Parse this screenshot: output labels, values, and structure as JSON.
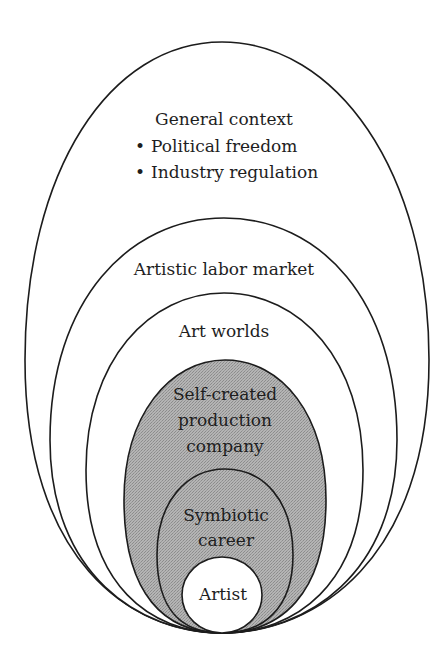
{
  "diagram": {
    "type": "nested-ellipses",
    "colors": {
      "stroke": "#1c1c1c",
      "background": "#ffffff",
      "shaded_fill": "#a9a9a9",
      "text": "#1e1e1e"
    },
    "layers": [
      {
        "id": "general-context",
        "title": "General context",
        "bullets": [
          "Political freedom",
          "Industry regulation"
        ],
        "shaded": false
      },
      {
        "id": "artistic-labor-market",
        "title": "Artistic labor market",
        "shaded": false
      },
      {
        "id": "art-worlds",
        "title": "Art worlds",
        "shaded": false
      },
      {
        "id": "self-created-production-company",
        "lines": [
          "Self-created",
          "production",
          "company"
        ],
        "shaded": true
      },
      {
        "id": "symbiotic-career",
        "lines": [
          "Symbiotic",
          "career"
        ],
        "shaded": true
      },
      {
        "id": "artist",
        "title": "Artist",
        "shaded": false
      }
    ],
    "bullet_glyph": "•"
  }
}
